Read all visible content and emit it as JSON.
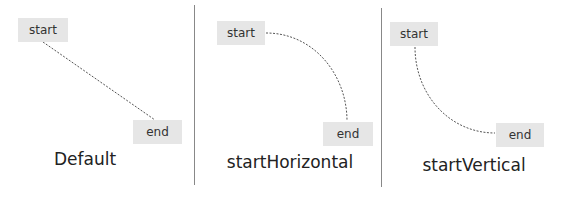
{
  "colors": {
    "node_fill": "#e6e6e6",
    "node_text": "#333333",
    "connector": "#555555",
    "divider": "#888888",
    "caption_text": "#222222"
  },
  "panels": [
    {
      "caption": "Default",
      "start_label": "start",
      "end_label": "end",
      "connector_style": "straight-dashed"
    },
    {
      "caption": "startHorizontal",
      "start_label": "start",
      "end_label": "end",
      "connector_style": "curve-start-horizontal-dashed"
    },
    {
      "caption": "startVertical",
      "start_label": "start",
      "end_label": "end",
      "connector_style": "curve-start-vertical-dashed"
    }
  ]
}
